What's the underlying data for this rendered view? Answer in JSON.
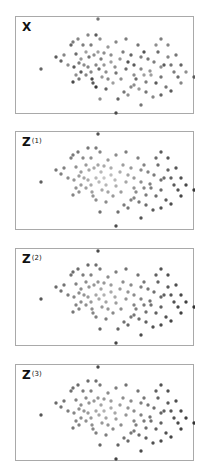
{
  "chart_data": [
    {
      "type": "scatter",
      "title": "X",
      "title_sup": "",
      "xlabel": "",
      "ylabel": "",
      "grid": false,
      "note": "Point coordinates in panel-local pixels (0..179 x 0..98); shade = gray level 0 (black) .. 1 (white-ish)",
      "points": [
        [
          82,
          2,
          0.45
        ],
        [
          25,
          52,
          0.35
        ],
        [
          40,
          40,
          0.3
        ],
        [
          45,
          44,
          0.35
        ],
        [
          55,
          28,
          0.35
        ],
        [
          57,
          25,
          0.5
        ],
        [
          62,
          22,
          0.55
        ],
        [
          67,
          28,
          0.5
        ],
        [
          72,
          18,
          0.55
        ],
        [
          75,
          28,
          0.5
        ],
        [
          80,
          18,
          0.3
        ],
        [
          84,
          22,
          0.6
        ],
        [
          70,
          35,
          0.7
        ],
        [
          73,
          40,
          0.45
        ],
        [
          78,
          38,
          0.6
        ],
        [
          82,
          35,
          0.7
        ],
        [
          85,
          42,
          0.5
        ],
        [
          88,
          36,
          0.6
        ],
        [
          92,
          30,
          0.65
        ],
        [
          95,
          38,
          0.6
        ],
        [
          60,
          37,
          0.4
        ],
        [
          63,
          46,
          0.5
        ],
        [
          58,
          50,
          0.3
        ],
        [
          52,
          48,
          0.6
        ],
        [
          48,
          38,
          0.55
        ],
        [
          65,
          55,
          0.3
        ],
        [
          70,
          58,
          0.55
        ],
        [
          76,
          62,
          0.2
        ],
        [
          80,
          48,
          0.55
        ],
        [
          83,
          52,
          0.4
        ],
        [
          86,
          60,
          0.65
        ],
        [
          90,
          55,
          0.6
        ],
        [
          80,
          70,
          0.1
        ],
        [
          77,
          66,
          0.3
        ],
        [
          63,
          62,
          0.45
        ],
        [
          57,
          65,
          0.2
        ],
        [
          90,
          72,
          0.35
        ],
        [
          100,
          56,
          0.45
        ],
        [
          105,
          62,
          0.6
        ],
        [
          110,
          52,
          0.4
        ],
        [
          112,
          45,
          0.25
        ],
        [
          118,
          48,
          0.3
        ],
        [
          125,
          40,
          0.5
        ],
        [
          128,
          35,
          0.25
        ],
        [
          132,
          42,
          0.45
        ],
        [
          138,
          45,
          0.5
        ],
        [
          142,
          35,
          0.4
        ],
        [
          148,
          48,
          0.3
        ],
        [
          152,
          40,
          0.55
        ],
        [
          155,
          48,
          0.45
        ],
        [
          158,
          55,
          0.5
        ],
        [
          162,
          60,
          0.4
        ],
        [
          165,
          66,
          0.55
        ],
        [
          145,
          60,
          0.45
        ],
        [
          140,
          66,
          0.3
        ],
        [
          130,
          65,
          0.5
        ],
        [
          120,
          62,
          0.4
        ],
        [
          115,
          70,
          0.55
        ],
        [
          108,
          75,
          0.45
        ],
        [
          112,
          78,
          0.6
        ],
        [
          125,
          52,
          0.55
        ],
        [
          134,
          54,
          0.65
        ],
        [
          145,
          50,
          0.6
        ],
        [
          150,
          70,
          0.45
        ],
        [
          155,
          74,
          0.3
        ],
        [
          145,
          78,
          0.35
        ],
        [
          140,
          28,
          0.6
        ],
        [
          145,
          22,
          0.5
        ],
        [
          122,
          28,
          0.45
        ],
        [
          110,
          22,
          0.5
        ],
        [
          100,
          25,
          0.55
        ],
        [
          95,
          45,
          0.7
        ],
        [
          104,
          42,
          0.65
        ],
        [
          99,
          50,
          0.6
        ],
        [
          118,
          58,
          0.6
        ],
        [
          128,
          58,
          0.7
        ],
        [
          135,
          58,
          0.7
        ],
        [
          160,
          38,
          0.45
        ],
        [
          170,
          55,
          0.6
        ],
        [
          165,
          48,
          0.35
        ],
        [
          102,
          82,
          0.35
        ],
        [
          84,
          82,
          0.6
        ],
        [
          125,
          88,
          0.45
        ],
        [
          100,
          96,
          0.2
        ],
        [
          178,
          60,
          0.3
        ],
        [
          65,
          42,
          0.65
        ],
        [
          68,
          48,
          0.6
        ],
        [
          72,
          50,
          0.55
        ],
        [
          88,
          48,
          0.65
        ],
        [
          92,
          62,
          0.55
        ],
        [
          75,
          55,
          0.55
        ],
        [
          60,
          58,
          0.6
        ],
        [
          97,
          66,
          0.7
        ],
        [
          115,
          38,
          0.35
        ],
        [
          107,
          35,
          0.5
        ],
        [
          130,
          75,
          0.45
        ],
        [
          137,
          80,
          0.55
        ],
        [
          152,
          28,
          0.55
        ],
        [
          118,
          68,
          0.6
        ],
        [
          123,
          72,
          0.65
        ]
      ]
    },
    {
      "type": "scatter",
      "title": "Z",
      "title_sup": "(1)",
      "grid": false
    },
    {
      "type": "scatter",
      "title": "Z",
      "title_sup": "(2)",
      "grid": false
    },
    {
      "type": "scatter",
      "title": "Z",
      "title_sup": "(3)",
      "grid": false
    }
  ],
  "panels": [
    {
      "label": "X",
      "sup": ""
    },
    {
      "label": "Z",
      "sup": "(1)"
    },
    {
      "label": "Z",
      "sup": "(2)"
    },
    {
      "label": "Z",
      "sup": "(3)"
    }
  ]
}
